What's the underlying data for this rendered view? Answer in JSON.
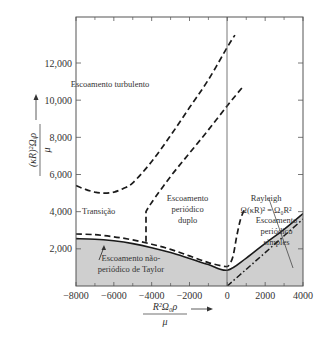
{
  "chart_data": {
    "type": "line",
    "title": "",
    "xlabel": "R²Ω₀ρ / μ",
    "xlabel_num": "R²Ω₀ρ",
    "xlabel_den": "μ",
    "ylabel": "(κR)²Ωᵢρ / μ",
    "ylabel_num": "(κR)²Ωᵢρ",
    "ylabel_den": "μ",
    "xlim": [
      -8000,
      4000
    ],
    "ylim": [
      0,
      13500
    ],
    "xticks": [
      -8000,
      -6000,
      -4000,
      -2000,
      0,
      2000,
      4000
    ],
    "xtick_labels": [
      "−8000",
      "−6000",
      "−4000",
      "−2000",
      "0",
      "2000",
      "4000"
    ],
    "yticks": [
      2000,
      4000,
      6000,
      8000,
      10000,
      12000
    ],
    "ytick_labels": [
      "2,000",
      "4,000",
      "6,000",
      "8,000",
      "10,000",
      "12,000"
    ],
    "grid": false,
    "colors": {
      "shade": "#cfcfcf",
      "line": "#1a1a1a",
      "axis": "#555555"
    },
    "series": [
      {
        "name": "taylor-stability-boundary",
        "style": "solid",
        "x": [
          -8000,
          -7000,
          -6000,
          -5000,
          -4000,
          -3000,
          -2000,
          -1000,
          0,
          1000,
          2000,
          3000,
          4000
        ],
        "y": [
          2550,
          2520,
          2430,
          2280,
          2060,
          1800,
          1480,
          1150,
          850,
          1500,
          2300,
          3050,
          3900
        ]
      },
      {
        "name": "rayleigh-line",
        "style": "dash-dot",
        "x": [
          0,
          1000,
          2000,
          3000,
          4000
        ],
        "y": [
          0,
          900,
          1800,
          2700,
          3600
        ]
      },
      {
        "name": "transition-lower-boundary",
        "style": "dashed",
        "x": [
          -8000,
          -7000,
          -6000,
          -5000,
          -4000,
          -3000,
          -2000,
          -1000,
          -100,
          100,
          300,
          500,
          700,
          900
        ],
        "y": [
          2800,
          2760,
          2650,
          2480,
          2250,
          1970,
          1620,
          1260,
          1050,
          1150,
          1600,
          2700,
          3600,
          4100
        ]
      },
      {
        "name": "doubly-periodic-boundary",
        "style": "dashed",
        "x": [
          -4300,
          -4300,
          -4000,
          -3000,
          -2000,
          -1000,
          0,
          800
        ],
        "y": [
          2380,
          4000,
          4500,
          5900,
          7150,
          8400,
          9700,
          10700
        ]
      },
      {
        "name": "turbulent-boundary",
        "style": "dashed",
        "x": [
          -8000,
          -7500,
          -7000,
          -6500,
          -6000,
          -5500,
          -5000,
          -4000,
          -3000,
          -2000,
          -1000,
          0,
          400
        ],
        "y": [
          5400,
          5200,
          5050,
          5000,
          5050,
          5250,
          5550,
          6700,
          8100,
          9600,
          11100,
          12850,
          13500
        ]
      }
    ],
    "shaded_region": "below taylor-stability-boundary",
    "annotations": [
      {
        "text": "Escoamento turbulento",
        "x": -6200,
        "y": 10700
      },
      {
        "text": "Transição",
        "x": -6800,
        "y": 3850
      },
      {
        "text": "Escoamento",
        "x": -2100,
        "y": 4600
      },
      {
        "text": "periódico",
        "x": -2100,
        "y": 4000
      },
      {
        "text": "duplo",
        "x": -2100,
        "y": 3400
      },
      {
        "text": "Rayleigh",
        "x": 2050,
        "y": 4550
      },
      {
        "text": "Ω(κR)² = Ω₀R²",
        "x": 2050,
        "y": 3950
      },
      {
        "text": "Escoamento",
        "x": 2600,
        "y": 3400
      },
      {
        "text": "periódico",
        "x": 2600,
        "y": 2800
      },
      {
        "text": "simples",
        "x": 2600,
        "y": 2200
      },
      {
        "text": "Escoamento não-",
        "x": -5100,
        "y": 1350
      },
      {
        "text": "periódico de Taylor",
        "x": -5100,
        "y": 750
      }
    ]
  }
}
